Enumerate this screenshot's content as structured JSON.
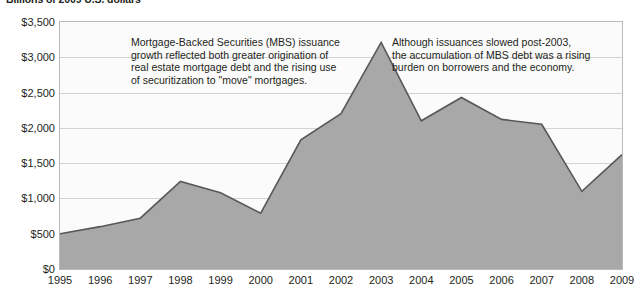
{
  "chart_data": {
    "type": "area",
    "title": "Billions of 2009 U.S. dollars",
    "xlabel": "",
    "ylabel": "",
    "categories": [
      "1995",
      "1996",
      "1997",
      "1998",
      "1999",
      "2000",
      "2001",
      "2002",
      "2003",
      "2004",
      "2005",
      "2006",
      "2007",
      "2008",
      "2009"
    ],
    "values": [
      500,
      600,
      720,
      1240,
      1080,
      790,
      1830,
      2200,
      3210,
      2100,
      2430,
      2120,
      2050,
      1100,
      1620
    ],
    "ylim": [
      0,
      3500
    ],
    "xlim": [
      "1995",
      "2009"
    ],
    "y_ticks": [
      0,
      500,
      1000,
      1500,
      2000,
      2500,
      3000,
      3500
    ],
    "y_tick_labels": [
      "$0",
      "$500",
      "$1,000",
      "$1,500",
      "$2,000",
      "$2,500",
      "$3,000",
      "$3,500"
    ],
    "grid": true,
    "legend": "none",
    "series": [
      {
        "name": "MBS issuance",
        "values": [
          500,
          600,
          720,
          1240,
          1080,
          790,
          1830,
          2200,
          3210,
          2100,
          2430,
          2120,
          2050,
          1100,
          1620
        ]
      }
    ],
    "annotations": [
      {
        "id": "left",
        "text": "Mortgage-Backed Securities (MBS) issuance\ngrowth reflected both greater origination of\nreal estate mortgage debt and the rising use\nof securitization to \"move\" mortgages."
      },
      {
        "id": "right",
        "text": "Although issuances slowed post-2003,\nthe accumulation of MBS debt was a rising\nburden on borrowers and the economy."
      }
    ],
    "colors": {
      "area_fill": "#a8a8a8",
      "area_line": "#58585a",
      "gridline": "#d2d2d2",
      "plot_background": "#fbfbfb",
      "plot_border": "#b9b9b9",
      "text": "#231f20"
    }
  }
}
